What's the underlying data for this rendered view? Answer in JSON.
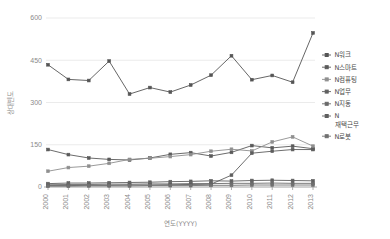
{
  "chart_data": {
    "type": "line",
    "title": "",
    "xlabel": "연도(YYYY)",
    "ylabel": "상대빈도",
    "categories": [
      "2000",
      "2001",
      "2002",
      "2003",
      "2004",
      "2005",
      "2006",
      "2007",
      "2008",
      "2009",
      "2010",
      "2011",
      "2012",
      "2013"
    ],
    "x": [
      2000,
      2001,
      2002,
      2003,
      2004,
      2005,
      2006,
      2007,
      2008,
      2009,
      2010,
      2011,
      2012,
      2013
    ],
    "ylim": [
      0,
      600
    ],
    "yticks": [
      0,
      150,
      300,
      450,
      600
    ],
    "xlim": [
      2000,
      2013
    ],
    "grid": true,
    "legend_position": "right",
    "series": [
      {
        "name": "N워크",
        "values": [
          434,
          382,
          378,
          447,
          330,
          353,
          337,
          362,
          397,
          466,
          381,
          396,
          372,
          547
        ]
      },
      {
        "name": "N스마트",
        "values": [
          133,
          115,
          103,
          98,
          96,
          103,
          116,
          122,
          110,
          123,
          147,
          139,
          145,
          136
        ]
      },
      {
        "name": "N컴퓨팅",
        "values": [
          56,
          69,
          74,
          84,
          98,
          102,
          108,
          115,
          127,
          134,
          128,
          160,
          178,
          145
        ]
      },
      {
        "name": "N업무",
        "values": [
          12,
          14,
          14,
          15,
          16,
          17,
          19,
          20,
          22,
          21,
          23,
          24,
          23,
          22
        ]
      },
      {
        "name": "N자동",
        "values": [
          8,
          9,
          9,
          10,
          10,
          11,
          11,
          12,
          12,
          13,
          13,
          14,
          13,
          13
        ]
      },
      {
        "name": "N재택근무",
        "values": [
          5,
          5,
          6,
          6,
          7,
          7,
          8,
          9,
          10,
          42,
          120,
          127,
          133,
          133
        ]
      },
      {
        "name": "N로봇",
        "values": [
          3,
          3,
          4,
          4,
          4,
          5,
          5,
          5,
          6,
          6,
          7,
          7,
          7,
          7
        ]
      }
    ]
  },
  "legend": {
    "items": [
      {
        "label": "N워크",
        "marker": "square-marker",
        "color": "#555555"
      },
      {
        "label": "N스마트",
        "marker": "square-marker",
        "color": "#5a5a5a"
      },
      {
        "label": "N컴퓨팅",
        "marker": "square-marker",
        "color": "#8f8f8f"
      },
      {
        "label": "N업무",
        "marker": "square-marker",
        "color": "#606060"
      },
      {
        "label": "N지동",
        "marker": "square-marker",
        "color": "#6a6a6a"
      },
      {
        "label": "N",
        "marker": "square-marker",
        "color": "#5e5e5e",
        "label2": "재택근무"
      },
      {
        "label": "N로봇",
        "marker": "square-marker",
        "color": "#707070"
      }
    ]
  },
  "axes": {
    "y_ticks": [
      "600",
      "450",
      "300",
      "150",
      "0"
    ],
    "x_ticks": [
      "2000",
      "2001",
      "2002",
      "2003",
      "2004",
      "2005",
      "2006",
      "2007",
      "2008",
      "2009",
      "2010",
      "2011",
      "2012",
      "2013"
    ],
    "y_title": "상대빈도",
    "x_title": "연도(YYYY)"
  },
  "colors": {
    "grid": "#e2e2e2",
    "axis": "#9a9a9a",
    "tick_label": "#8a8a8a",
    "legend_label": "#4a4a4a",
    "background": "#ffffff"
  }
}
